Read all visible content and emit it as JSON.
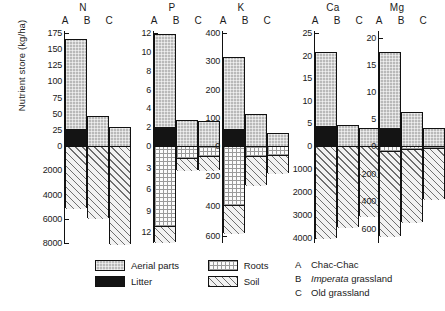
{
  "axis": {
    "ylabel": "Nutrient store (kg/ha)"
  },
  "legend": {
    "items": [
      {
        "label": "Aerial parts",
        "pattern": "aerial",
        "color": "#b9b9b9"
      },
      {
        "label": "Litter",
        "pattern": "litter",
        "color": "#141414"
      },
      {
        "label": "Roots",
        "pattern": "roots",
        "color": "#fbfbfb"
      },
      {
        "label": "Soil",
        "pattern": "soil",
        "color": "#f2f2f2"
      }
    ]
  },
  "key": {
    "rows": [
      {
        "letter": "A",
        "text": "Chac-Chac",
        "italic_word": ""
      },
      {
        "letter": "B",
        "text": " grassland",
        "italic_word": "Imperata"
      },
      {
        "letter": "C",
        "text": "Old grassland",
        "italic_word": ""
      }
    ]
  },
  "group_labels": [
    "A",
    "B",
    "C"
  ],
  "chart_data": {
    "type": "bar",
    "ylabel": "Nutrient store (kg/ha)",
    "xlabel": "",
    "grid": false,
    "legend_position": "bottom-left",
    "note": "Stacked bars; positive axis = aerial parts + litter, negative axis = roots + soil (separate scale).",
    "categories": [
      "A",
      "B",
      "C"
    ],
    "category_meaning": [
      "Chac-Chac",
      "Imperata grassland",
      "Old grassland"
    ],
    "series": [
      {
        "name": "Aerial parts",
        "stack": "positive"
      },
      {
        "name": "Litter",
        "stack": "positive"
      },
      {
        "name": "Roots",
        "stack": "negative"
      },
      {
        "name": "Soil",
        "stack": "negative"
      }
    ],
    "panels": [
      {
        "name": "N",
        "pos_ticks": [
          0,
          25,
          50,
          75,
          100,
          125,
          150,
          175
        ],
        "neg_ticks": [
          0,
          2000,
          4000,
          6000,
          8000
        ],
        "pos_max": 175,
        "neg_max": 8000,
        "bars": [
          {
            "cat": "A",
            "litter": 28,
            "aerial": 137,
            "total_pos": 165,
            "roots": 0,
            "soil": 5100,
            "total_neg": 5100
          },
          {
            "cat": "B",
            "litter": 0,
            "aerial": 46,
            "total_pos": 46,
            "roots": 0,
            "soil": 5900,
            "total_neg": 5900
          },
          {
            "cat": "C",
            "litter": 0,
            "aerial": 29,
            "total_pos": 29,
            "roots": 0,
            "soil": 8100,
            "total_neg": 8100
          }
        ]
      },
      {
        "name": "P",
        "pos_ticks": [
          0,
          2,
          4,
          6,
          8,
          10,
          12
        ],
        "neg_ticks": [
          0,
          3,
          6,
          9,
          12
        ],
        "pos_max": 12,
        "neg_max": 13.5,
        "bars": [
          {
            "cat": "A",
            "litter": 2.1,
            "aerial": 9.8,
            "total_pos": 11.9,
            "roots": 11.0,
            "soil": 2.3,
            "total_neg": 13.3
          },
          {
            "cat": "B",
            "litter": 0,
            "aerial": 2.8,
            "total_pos": 2.8,
            "roots": 1.6,
            "soil": 1.7,
            "total_neg": 3.3
          },
          {
            "cat": "C",
            "litter": 0,
            "aerial": 2.7,
            "total_pos": 2.7,
            "roots": 1.3,
            "soil": 2.0,
            "total_neg": 3.3
          }
        ]
      },
      {
        "name": "K",
        "pos_ticks": [
          0,
          100,
          200,
          300,
          400
        ],
        "neg_ticks": [
          0,
          200,
          400,
          600
        ],
        "pos_max": 400,
        "neg_max": 650,
        "bars": [
          {
            "cat": "A",
            "litter": 62,
            "aerial": 253,
            "total_pos": 315,
            "roots": 390,
            "soil": 195,
            "total_neg": 585
          },
          {
            "cat": "B",
            "litter": 0,
            "aerial": 112,
            "total_pos": 112,
            "roots": 60,
            "soil": 200,
            "total_neg": 260
          },
          {
            "cat": "C",
            "litter": 0,
            "aerial": 47,
            "total_pos": 47,
            "roots": 55,
            "soil": 125,
            "total_neg": 180
          }
        ]
      },
      {
        "name": "Ca",
        "pos_ticks": [
          0,
          5,
          10,
          15,
          20,
          25
        ],
        "neg_ticks": [
          0,
          1000,
          2000,
          3000,
          4000
        ],
        "pos_max": 25,
        "neg_max": 4200,
        "bars": [
          {
            "cat": "A",
            "litter": 4.6,
            "aerial": 16.3,
            "total_pos": 20.9,
            "roots": 0,
            "soil": 3980,
            "total_neg": 3980
          },
          {
            "cat": "B",
            "litter": 0,
            "aerial": 4.7,
            "total_pos": 4.7,
            "roots": 0,
            "soil": 3500,
            "total_neg": 3500
          },
          {
            "cat": "C",
            "litter": 0,
            "aerial": 4.0,
            "total_pos": 4.0,
            "roots": 0,
            "soil": 3050,
            "total_neg": 3050
          }
        ]
      },
      {
        "name": "Mg",
        "pos_ticks": [
          0,
          5,
          10,
          15,
          20
        ],
        "neg_ticks": [
          0,
          200,
          400,
          600
        ],
        "pos_max": 21,
        "neg_max": 700,
        "bars": [
          {
            "cat": "A",
            "litter": 3.6,
            "aerial": 13.9,
            "total_pos": 17.5,
            "roots": 30,
            "soil": 620,
            "total_neg": 650
          },
          {
            "cat": "B",
            "litter": 0,
            "aerial": 6.4,
            "total_pos": 6.4,
            "roots": 12,
            "soil": 533,
            "total_neg": 545
          },
          {
            "cat": "C",
            "litter": 0,
            "aerial": 3.4,
            "total_pos": 3.4,
            "roots": 10,
            "soil": 370,
            "total_neg": 380
          }
        ]
      }
    ]
  }
}
